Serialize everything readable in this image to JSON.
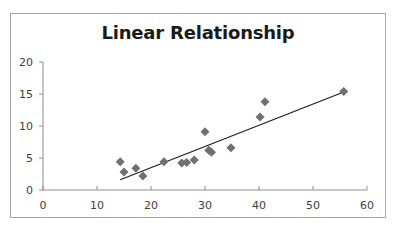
{
  "chart_data": {
    "type": "scatter",
    "title": "Linear Relationship",
    "xlabel": "",
    "ylabel": "",
    "xlim": [
      0,
      60
    ],
    "ylim": [
      0,
      20
    ],
    "x_ticks": [
      0,
      10,
      20,
      30,
      40,
      50,
      60
    ],
    "y_ticks": [
      0,
      5,
      10,
      15,
      20
    ],
    "grid": false,
    "legend": null,
    "marker": "diamond",
    "marker_color": "#707070",
    "series": [
      {
        "name": "data",
        "points": [
          {
            "x": 14.3,
            "y": 4.4
          },
          {
            "x": 15.0,
            "y": 2.8
          },
          {
            "x": 17.2,
            "y": 3.4
          },
          {
            "x": 18.5,
            "y": 2.2
          },
          {
            "x": 22.4,
            "y": 4.4
          },
          {
            "x": 25.7,
            "y": 4.2
          },
          {
            "x": 26.6,
            "y": 4.3
          },
          {
            "x": 28.0,
            "y": 4.7
          },
          {
            "x": 30.0,
            "y": 9.1
          },
          {
            "x": 30.7,
            "y": 6.2
          },
          {
            "x": 31.2,
            "y": 5.9
          },
          {
            "x": 34.8,
            "y": 6.6
          },
          {
            "x": 40.2,
            "y": 11.4
          },
          {
            "x": 41.1,
            "y": 13.8
          },
          {
            "x": 55.7,
            "y": 15.4
          }
        ]
      }
    ],
    "trendline": {
      "type": "linear",
      "color": "#1a1a1a",
      "start": {
        "x": 14.3,
        "y": 1.6
      },
      "end": {
        "x": 55.7,
        "y": 15.3
      }
    }
  },
  "layout": {
    "plot_left_px": 43,
    "plot_right_px": 367,
    "plot_top_px": 62,
    "plot_bottom_px": 190
  }
}
